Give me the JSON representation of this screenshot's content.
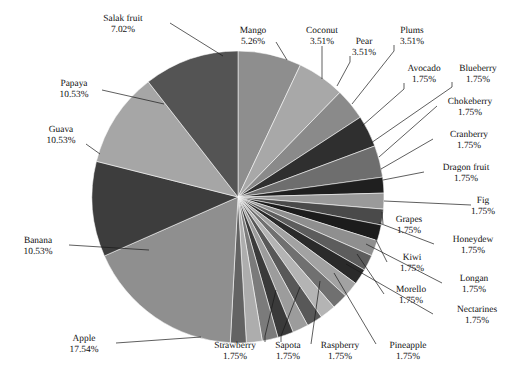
{
  "chart_data": {
    "type": "pie",
    "title": "",
    "subtitle": "",
    "xlabel": "",
    "ylabel": "",
    "legend_position": "none",
    "grid": false,
    "value_suffix": "%",
    "start_angle_deg": 0,
    "direction": "clockwise",
    "categories": [
      "Salak fruit",
      "Mango",
      "Coconut",
      "Pear",
      "Plums",
      "Avocado",
      "Blueberry",
      "Chokeberry",
      "Cranberry",
      "Dragon fruit",
      "Fig",
      "Grapes",
      "Honeydew",
      "Kiwi",
      "Longan",
      "Morello",
      "Nectarines",
      "Pineapple",
      "Raspberry",
      "Sapota",
      "Strawberry",
      "Apple",
      "Banana",
      "Guava",
      "Papaya"
    ],
    "values": [
      7.02,
      5.26,
      3.51,
      3.51,
      3.51,
      1.75,
      1.75,
      1.75,
      1.75,
      1.75,
      1.75,
      1.75,
      1.75,
      1.75,
      1.75,
      1.75,
      1.75,
      1.75,
      1.75,
      1.75,
      1.75,
      17.54,
      10.53,
      10.53,
      10.53
    ],
    "slices": [
      {
        "label": "Salak fruit",
        "value": 7.02,
        "value_text": "7.02%",
        "color": "#8e8e8e"
      },
      {
        "label": "Mango",
        "value": 5.26,
        "value_text": "5.26%",
        "color": "#a8a8a8"
      },
      {
        "label": "Coconut",
        "value": 3.51,
        "value_text": "3.51%",
        "color": "#8a8a8a"
      },
      {
        "label": "Pear",
        "value": 3.51,
        "value_text": "3.51%",
        "color": "#2f2f2f"
      },
      {
        "label": "Plums",
        "value": 3.51,
        "value_text": "3.51%",
        "color": "#6e6e6e"
      },
      {
        "label": "Avocado",
        "value": 1.75,
        "value_text": "1.75%",
        "color": "#1f1f1f"
      },
      {
        "label": "Blueberry",
        "value": 1.75,
        "value_text": "1.75%",
        "color": "#9a9a9a"
      },
      {
        "label": "Chokeberry",
        "value": 1.75,
        "value_text": "1.75%",
        "color": "#4a4a4a"
      },
      {
        "label": "Cranberry",
        "value": 1.75,
        "value_text": "1.75%",
        "color": "#1c1c1c"
      },
      {
        "label": "Dragon fruit",
        "value": 1.75,
        "value_text": "1.75%",
        "color": "#8f8f8f"
      },
      {
        "label": "Fig",
        "value": 1.75,
        "value_text": "1.75%",
        "color": "#5d5d5d"
      },
      {
        "label": "Grapes",
        "value": 1.75,
        "value_text": "1.75%",
        "color": "#2a2a2a"
      },
      {
        "label": "Honeydew",
        "value": 1.75,
        "value_text": "1.75%",
        "color": "#a2a2a2"
      },
      {
        "label": "Kiwi",
        "value": 1.75,
        "value_text": "1.75%",
        "color": "#707070"
      },
      {
        "label": "Longan",
        "value": 1.75,
        "value_text": "1.75%",
        "color": "#b4b4b4"
      },
      {
        "label": "Morello",
        "value": 1.75,
        "value_text": "1.75%",
        "color": "#585858"
      },
      {
        "label": "Nectarines",
        "value": 1.75,
        "value_text": "1.75%",
        "color": "#9c9c9c"
      },
      {
        "label": "Pineapple",
        "value": 1.75,
        "value_text": "1.75%",
        "color": "#3a3a3a"
      },
      {
        "label": "Raspberry",
        "value": 1.75,
        "value_text": "1.75%",
        "color": "#7b7b7b"
      },
      {
        "label": "Sapota",
        "value": 1.75,
        "value_text": "1.75%",
        "color": "#adadad"
      },
      {
        "label": "Strawberry",
        "value": 1.75,
        "value_text": "1.75%",
        "color": "#636363"
      },
      {
        "label": "Apple",
        "value": 17.54,
        "value_text": "17.54%",
        "color": "#8f8f8f"
      },
      {
        "label": "Banana",
        "value": 10.53,
        "value_text": "10.53%",
        "color": "#3d3d3d"
      },
      {
        "label": "Guava",
        "value": 10.53,
        "value_text": "10.53%",
        "color": "#a6a6a6"
      },
      {
        "label": "Papaya",
        "value": 10.53,
        "value_text": "10.53%",
        "color": "#545454"
      }
    ]
  },
  "geometry": {
    "center_x": 238,
    "center_y": 197,
    "radius": 146
  },
  "labels": [
    {
      "name": "salak-fruit",
      "title": "Salak fruit",
      "value_text": "7.02%",
      "tx": 123,
      "ty": 21,
      "anchor": "middle",
      "line": [
        [
          170,
          23
        ],
        [
          223,
          56
        ]
      ]
    },
    {
      "name": "mango",
      "title": "Mango",
      "value_text": "5.26%",
      "tx": 253,
      "ty": 33,
      "anchor": "middle",
      "line": [
        [
          276,
          42
        ],
        [
          287,
          60
        ]
      ]
    },
    {
      "name": "coconut",
      "title": "Coconut",
      "value_text": "3.51%",
      "tx": 322,
      "ty": 33,
      "anchor": "middle",
      "line": [
        [
          322,
          46
        ],
        [
          322,
          79
        ]
      ]
    },
    {
      "name": "pear",
      "title": "Pear",
      "value_text": "3.51%",
      "tx": 364,
      "ty": 44,
      "anchor": "middle",
      "line": [
        [
          350,
          56
        ],
        [
          350,
          62
        ],
        [
          337,
          86
        ]
      ]
    },
    {
      "name": "plums",
      "title": "Plums",
      "value_text": "3.51%",
      "tx": 412,
      "ty": 33,
      "anchor": "middle",
      "line": [
        [
          394,
          45
        ],
        [
          394,
          51
        ],
        [
          352,
          104
        ]
      ]
    },
    {
      "name": "avocado",
      "title": "Avocado",
      "value_text": "1.75%",
      "tx": 424,
      "ty": 71,
      "anchor": "middle",
      "line": [
        [
          404,
          83
        ],
        [
          404,
          89
        ],
        [
          362,
          126
        ]
      ]
    },
    {
      "name": "blueberry",
      "title": "Blueberry",
      "value_text": "1.75%",
      "tx": 478,
      "ty": 71,
      "anchor": "middle",
      "line": [
        [
          452,
          82
        ],
        [
          452,
          87
        ],
        [
          371,
          143
        ]
      ]
    },
    {
      "name": "chokeberry",
      "title": "Chokeberry",
      "value_text": "1.75%",
      "tx": 470,
      "ty": 104,
      "anchor": "middle",
      "line": [
        [
          437,
          106
        ],
        [
          379,
          157
        ]
      ]
    },
    {
      "name": "cranberry",
      "title": "Cranberry",
      "value_text": "1.75%",
      "tx": 469,
      "ty": 137,
      "anchor": "middle",
      "line": [
        [
          433,
          139
        ],
        [
          381,
          169
        ]
      ]
    },
    {
      "name": "dragon-fruit",
      "title": "Dragon fruit",
      "value_text": "1.75%",
      "tx": 466,
      "ty": 170,
      "anchor": "middle",
      "line": [
        [
          424,
          172
        ],
        [
          383,
          180
        ]
      ]
    },
    {
      "name": "fig",
      "title": "Fig",
      "value_text": "1.75%",
      "tx": 483,
      "ty": 203,
      "anchor": "middle",
      "line": [
        [
          471,
          205
        ],
        [
          384,
          201
        ]
      ]
    },
    {
      "name": "grapes",
      "title": "Grapes",
      "value_text": "1.75%",
      "tx": 409,
      "ty": 222,
      "anchor": "middle",
      "line": [
        [
          383,
          224
        ],
        [
          382,
          212
        ]
      ]
    },
    {
      "name": "honeydew",
      "title": "Honeydew",
      "value_text": "1.75%",
      "tx": 473,
      "ty": 242,
      "anchor": "middle",
      "line": [
        [
          434,
          244
        ],
        [
          379,
          223
        ]
      ]
    },
    {
      "name": "kiwi",
      "title": "Kiwi",
      "value_text": "1.75%",
      "tx": 412,
      "ty": 260,
      "anchor": "middle",
      "line": [
        [
          387,
          262
        ],
        [
          373,
          234
        ]
      ]
    },
    {
      "name": "longan",
      "title": "Longan",
      "value_text": "1.75%",
      "tx": 474,
      "ty": 281,
      "anchor": "middle",
      "line": [
        [
          442,
          283
        ],
        [
          366,
          244
        ]
      ]
    },
    {
      "name": "morello",
      "title": "Morello",
      "value_text": "1.75%",
      "tx": 411,
      "ty": 292,
      "anchor": "middle",
      "line": [
        [
          384,
          294
        ],
        [
          357,
          254
        ]
      ]
    },
    {
      "name": "nectarines",
      "title": "Nectarines",
      "value_text": "1.75%",
      "tx": 477,
      "ty": 312,
      "anchor": "middle",
      "line": [
        [
          433,
          314
        ],
        [
          346,
          264
        ]
      ]
    },
    {
      "name": "pineapple",
      "title": "Pineapple",
      "value_text": "1.75%",
      "tx": 408,
      "ty": 348,
      "anchor": "middle",
      "line": [
        [
          376,
          344
        ],
        [
          334,
          273
        ]
      ]
    },
    {
      "name": "raspberry",
      "title": "Raspberry",
      "value_text": "1.75%",
      "tx": 340,
      "ty": 348,
      "anchor": "middle",
      "line": [
        [
          311,
          344
        ],
        [
          320,
          281
        ]
      ]
    },
    {
      "name": "sapota",
      "title": "Sapota",
      "value_text": "1.75%",
      "tx": 288,
      "ty": 348,
      "anchor": "middle",
      "line": [
        [
          281,
          342
        ],
        [
          281,
          336
        ],
        [
          300,
          287
        ]
      ]
    },
    {
      "name": "strawberry",
      "title": "Strawberry",
      "value_text": "1.75%",
      "tx": 235,
      "ty": 348,
      "anchor": "middle",
      "line": [
        [
          265,
          342
        ],
        [
          265,
          336
        ],
        [
          276,
          290
        ]
      ]
    },
    {
      "name": "apple",
      "title": "Apple",
      "value_text": "17.54%",
      "tx": 84,
      "ty": 341,
      "anchor": "middle",
      "line": [
        [
          116,
          343
        ],
        [
          201,
          337
        ]
      ]
    },
    {
      "name": "banana",
      "title": "Banana",
      "value_text": "10.53%",
      "tx": 38,
      "ty": 243,
      "anchor": "middle",
      "line": [
        [
          69,
          245
        ],
        [
          149,
          250
        ]
      ]
    },
    {
      "name": "guava",
      "title": "Guava",
      "value_text": "10.53%",
      "tx": 61,
      "ty": 132,
      "anchor": "middle",
      "line": [
        [
          86,
          144
        ],
        [
          100,
          154
        ]
      ]
    },
    {
      "name": "papaya",
      "title": "Papaya",
      "value_text": "10.53%",
      "tx": 74,
      "ty": 86,
      "anchor": "middle",
      "line": [
        [
          102,
          90
        ],
        [
          164,
          104
        ]
      ]
    }
  ]
}
